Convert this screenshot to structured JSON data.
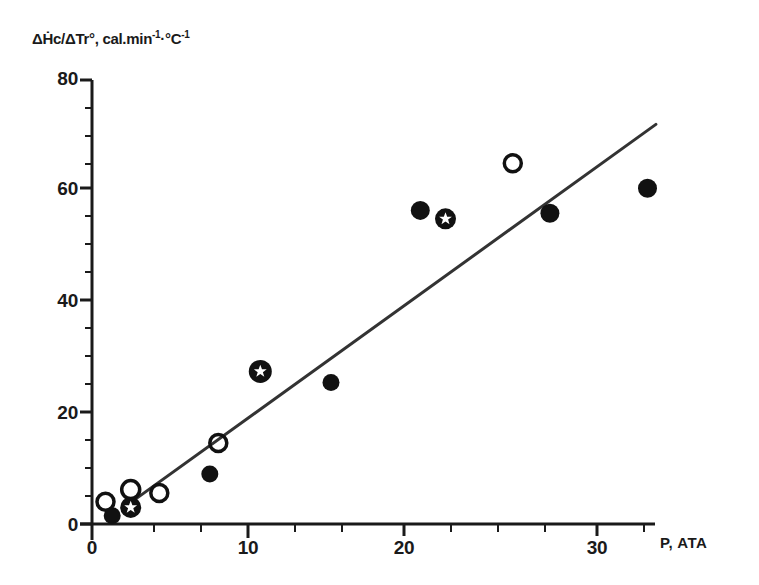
{
  "chart_data": {
    "type": "scatter",
    "title": "",
    "subtitle": "",
    "xlabel": "P, ATA",
    "ylabel": "ΔḢc/ΔTr°, cal.min⁻¹·°C⁻¹",
    "xlim": [
      0,
      35.5
    ],
    "ylim": [
      0,
      80
    ],
    "xticks": [
      0,
      10,
      20,
      30
    ],
    "yticks": [
      0,
      20,
      40,
      60,
      80
    ],
    "xtick_labels": [
      "0",
      "10",
      "20",
      "30"
    ],
    "ytick_labels": [
      "0",
      "20",
      "40",
      "60",
      "80"
    ],
    "x_minor_tick_interval": 2,
    "y_minor_tick_interval": 5,
    "grid": false,
    "legend": false,
    "legend_position": "none",
    "series": [
      {
        "name": "open-circle",
        "marker": "open_circle",
        "points": [
          {
            "x": 0.8,
            "y": 4.0
          },
          {
            "x": 2.3,
            "y": 6.2
          },
          {
            "x": 4.0,
            "y": 5.6
          },
          {
            "x": 7.5,
            "y": 14.6
          },
          {
            "x": 25.0,
            "y": 65.0
          }
        ]
      },
      {
        "name": "filled-circle",
        "marker": "filled_circle",
        "points": [
          {
            "x": 1.2,
            "y": 1.5
          },
          {
            "x": 7.0,
            "y": 9.0
          },
          {
            "x": 14.2,
            "y": 25.5
          },
          {
            "x": 19.5,
            "y": 56.5
          },
          {
            "x": 27.2,
            "y": 56.0
          },
          {
            "x": 33.0,
            "y": 60.5
          }
        ]
      },
      {
        "name": "star-in-circle",
        "marker": "star_in_circle",
        "points": [
          {
            "x": 2.3,
            "y": 3.0
          },
          {
            "x": 10.0,
            "y": 27.5
          },
          {
            "x": 21.0,
            "y": 55.0
          }
        ]
      }
    ],
    "trend_line": {
      "name": "regression-line",
      "x_start": 1.9,
      "y_start": 3.0,
      "x_end": 33.5,
      "y_end": 72.0
    },
    "colors": {
      "axis": "#1a1a1a",
      "marker": "#111111",
      "line": "#333333",
      "background": "#ffffff"
    }
  },
  "axis": {
    "y_title": "ΔḢc/ΔTr°, cal.min",
    "y_title_sup1": "-1",
    "y_title_mid": "·°C",
    "y_title_sup2": "-1",
    "x_title": "P, ATA",
    "y_labels": [
      "80",
      "60",
      "40",
      "20",
      "0"
    ],
    "x_labels": [
      "0",
      "10",
      "20",
      "30"
    ]
  }
}
